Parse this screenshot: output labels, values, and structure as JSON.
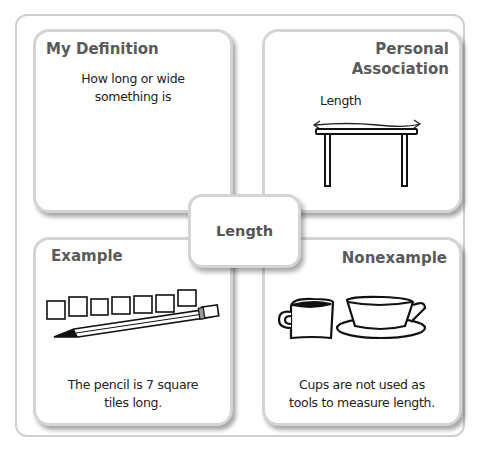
{
  "center_term": "Length",
  "quadrants": {
    "my_definition": {
      "title": "My Definition",
      "text_line1": "How long or wide",
      "text_line2": "something is"
    },
    "personal_association": {
      "title_line1": "Personal",
      "title_line2": "Association",
      "label": "Length",
      "illustration": "table-with-length-arrow"
    },
    "example": {
      "title": "Example",
      "text_line1": "The pencil is 7 square",
      "text_line2": "tiles long.",
      "illustration": "pencil-with-7-square-tiles"
    },
    "nonexample": {
      "title": "Nonexample",
      "text_line1": "Cups are not used as",
      "text_line2": "tools to measure length.",
      "illustration": "mug-and-teacup"
    }
  },
  "colors": {
    "title_text": "#5a5a5a",
    "card_border": "#d4d4d4",
    "frame_border": "#cfcfcf"
  }
}
